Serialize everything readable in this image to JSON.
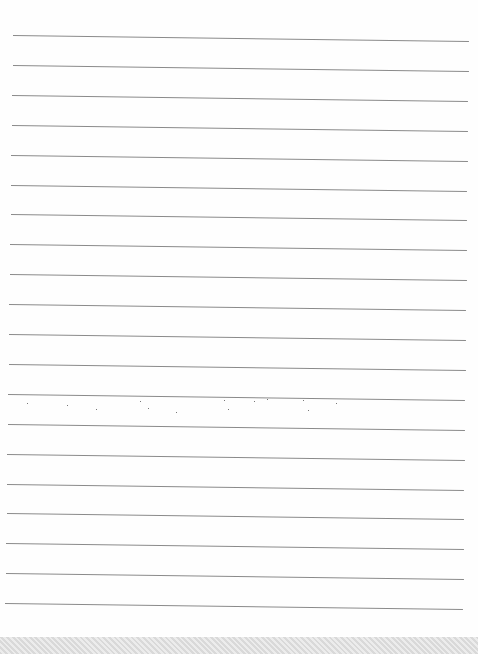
{
  "image": {
    "description": "Blank lined notebook paper with horizontal ruled lines",
    "line_count": 20,
    "line_color": "#8a8a8a",
    "paper_color": "#fefefe",
    "bottom_strip_color": "#e4e4e4"
  }
}
